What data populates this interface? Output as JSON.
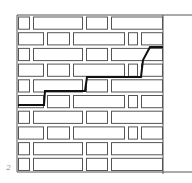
{
  "figure": {
    "label": "2",
    "colors": {
      "line": "#555555",
      "crack": "#111111",
      "background": "#ffffff"
    }
  },
  "wall": {
    "x0": 17,
    "x1": 163,
    "y0": 15,
    "y1": 172,
    "top_line_extends_to": 192,
    "bottom_line_extends_to": 192,
    "rows": [
      {
        "bricks": [
          [
            18,
            30
          ],
          [
            33,
            83
          ],
          [
            86,
            108
          ],
          [
            111,
            163
          ]
        ]
      },
      {
        "bricks": [
          [
            18,
            44
          ],
          [
            47,
            70
          ],
          [
            73,
            125
          ],
          [
            128,
            138
          ],
          [
            141,
            163
          ]
        ]
      },
      {
        "bricks": [
          [
            18,
            30
          ],
          [
            33,
            83
          ],
          [
            86,
            108
          ],
          [
            111,
            163
          ]
        ]
      },
      {
        "bricks": [
          [
            18,
            44
          ],
          [
            47,
            70
          ],
          [
            73,
            125
          ],
          [
            128,
            138
          ],
          [
            141,
            163
          ]
        ]
      },
      {
        "bricks": [
          [
            18,
            30
          ],
          [
            33,
            83
          ],
          [
            86,
            108
          ],
          [
            111,
            163
          ]
        ]
      },
      {
        "bricks": [
          [
            18,
            44
          ],
          [
            47,
            70
          ],
          [
            73,
            125
          ],
          [
            128,
            138
          ],
          [
            141,
            163
          ]
        ]
      },
      {
        "bricks": [
          [
            18,
            30
          ],
          [
            33,
            83
          ],
          [
            86,
            108
          ],
          [
            111,
            163
          ]
        ]
      },
      {
        "bricks": [
          [
            18,
            44
          ],
          [
            47,
            70
          ],
          [
            73,
            125
          ],
          [
            128,
            138
          ],
          [
            141,
            163
          ]
        ]
      },
      {
        "bricks": [
          [
            18,
            30
          ],
          [
            33,
            83
          ],
          [
            86,
            108
          ],
          [
            111,
            163
          ]
        ]
      },
      {
        "bricks": [
          [
            18,
            30
          ],
          [
            33,
            83
          ],
          [
            86,
            108
          ],
          [
            111,
            163
          ]
        ]
      }
    ]
  },
  "crack": {
    "points": [
      [
        163,
        47
      ],
      [
        150,
        47
      ],
      [
        143,
        60
      ],
      [
        141,
        77
      ],
      [
        128,
        77
      ],
      [
        87,
        77
      ],
      [
        85,
        91
      ],
      [
        70,
        91
      ],
      [
        45,
        91
      ],
      [
        44,
        105
      ],
      [
        18,
        105
      ]
    ]
  }
}
